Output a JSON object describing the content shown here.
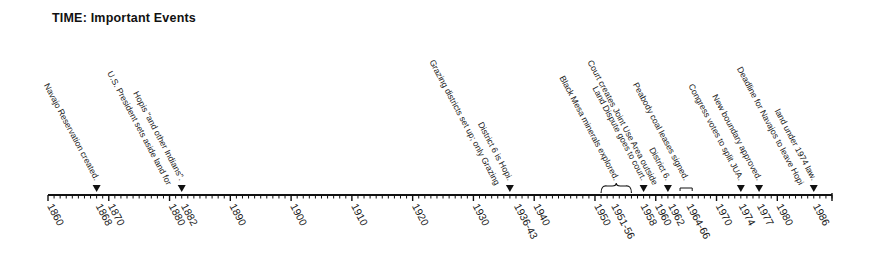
{
  "title": "TIME:  Important Events",
  "chart_data": {
    "type": "timeline",
    "title": "TIME:  Important Events",
    "axis": {
      "range": [
        1860,
        1989
      ],
      "minor_tick_step": 1,
      "major_tick_step": 10
    },
    "tick_labels": [
      {
        "label": "1860",
        "year": 1860
      },
      {
        "label": "1868",
        "year": 1868
      },
      {
        "label": "1870",
        "year": 1870
      },
      {
        "label": "1880",
        "year": 1880
      },
      {
        "label": "1882",
        "year": 1882
      },
      {
        "label": "1890",
        "year": 1890
      },
      {
        "label": "1900",
        "year": 1900
      },
      {
        "label": "1910",
        "year": 1910
      },
      {
        "label": "1920",
        "year": 1920
      },
      {
        "label": "1930",
        "year": 1930
      },
      {
        "label": "1936-43",
        "year": 1936.8
      },
      {
        "label": "1940",
        "year": 1940
      },
      {
        "label": "1950",
        "year": 1950
      },
      {
        "label": "1951-56",
        "year": 1952.8
      },
      {
        "label": "1958",
        "year": 1957.6
      },
      {
        "label": "1960",
        "year": 1960
      },
      {
        "label": "1962",
        "year": 1962.2
      },
      {
        "label": "1964-66",
        "year": 1965.2
      },
      {
        "label": "1970",
        "year": 1970
      },
      {
        "label": "1974",
        "year": 1973.8
      },
      {
        "label": "1977",
        "year": 1976.8
      },
      {
        "label": "1980",
        "year": 1980
      },
      {
        "label": "1986",
        "year": 1986
      }
    ],
    "events": [
      {
        "year": 1868,
        "marker": "triangle",
        "lines": [
          "Navajo Reservation created."
        ]
      },
      {
        "year": 1882,
        "marker": "triangle",
        "lines": [
          "U.S. President sets aside land for",
          "Hopis \"and other Indians\"."
        ]
      },
      {
        "year": 1936,
        "marker": "triangle",
        "lines": [
          "Grazing districts set up; only Grazing",
          "District 6 is Hopi."
        ]
      },
      {
        "year": "1951-56",
        "start": 1951,
        "end": 1956,
        "marker": "brace",
        "lines": [
          "Black Mesa minerals explored."
        ]
      },
      {
        "year": 1958,
        "marker": "triangle",
        "lines": [
          "Land Dispute goes to court."
        ]
      },
      {
        "year": 1962,
        "marker": "triangle",
        "lines": [
          "Court creates Joint Use Area outside",
          "District 6."
        ]
      },
      {
        "year": "1964-66",
        "start": 1964,
        "end": 1966,
        "marker": "bracket",
        "lines": [
          "Peabody coal leases signed."
        ]
      },
      {
        "year": 1974,
        "marker": "triangle",
        "lines": [
          "Congress votes to split JUA."
        ]
      },
      {
        "year": 1977,
        "marker": "triangle",
        "lines": [
          "New boundary approved."
        ]
      },
      {
        "year": 1986,
        "marker": "triangle",
        "lines": [
          "Deadline for Navajos to leave Hopi",
          "land under 1974 law."
        ]
      }
    ]
  }
}
